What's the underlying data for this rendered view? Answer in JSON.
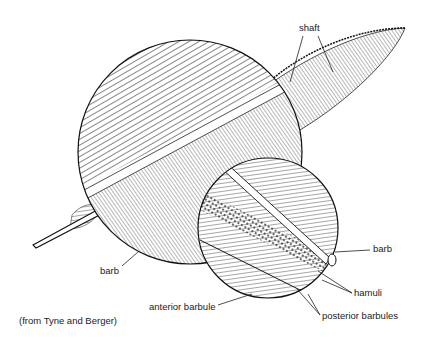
{
  "diagram": {
    "labels": {
      "shaft": "shaft",
      "barb_left": "barb",
      "barb_right": "barb",
      "hamuli": "hamuli",
      "anterior_barbule": "anterior barbule",
      "posterior_barbules": "posterior barbules"
    },
    "credit": "(from Tyne and Berger)",
    "colors": {
      "ink": "#1a1a1a",
      "background": "#ffffff"
    }
  }
}
